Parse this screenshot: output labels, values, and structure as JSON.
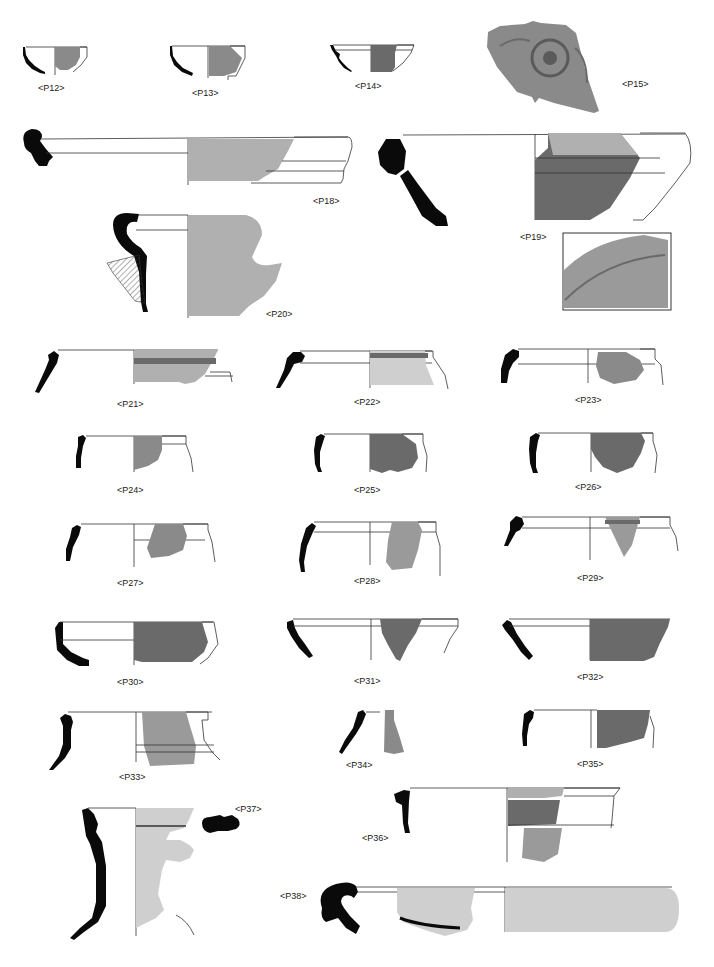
{
  "plate": {
    "labels": {
      "P12": "<P12>",
      "P13": "<P13>",
      "P14": "<P14>",
      "P15": "<P15>",
      "P18": "<P18>",
      "P19": "<P19>",
      "P20": "<P20>",
      "P21": "<P21>",
      "P22": "<P22>",
      "P23": "<P23>",
      "P24": "<P24>",
      "P25": "<P25>",
      "P26": "<P26>",
      "P27": "<P27>",
      "P28": "<P28>",
      "P29": "<P29>",
      "P30": "<P30>",
      "P31": "<P31>",
      "P32": "<P32>",
      "P33": "<P33>",
      "P34": "<P34>",
      "P35": "<P35>",
      "P36": "<P36>",
      "P37": "<P37>",
      "P38": "<P38>"
    }
  }
}
